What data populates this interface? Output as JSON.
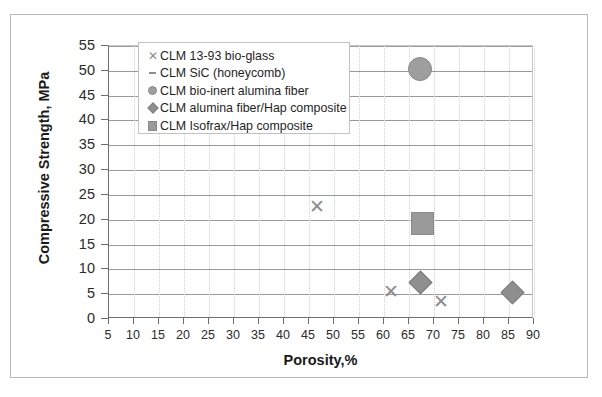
{
  "chart_data": {
    "type": "scatter",
    "title": "",
    "xlabel": "Porosity,%",
    "ylabel": "Compressive Strength, MPa",
    "xlim": [
      5,
      90
    ],
    "ylim": [
      0,
      55
    ],
    "xticks": [
      5,
      10,
      15,
      20,
      25,
      30,
      35,
      40,
      45,
      50,
      55,
      60,
      65,
      70,
      75,
      80,
      85,
      90
    ],
    "yticks": [
      0,
      5,
      10,
      15,
      20,
      25,
      30,
      35,
      40,
      45,
      50,
      55
    ],
    "grid": "horizontal",
    "legend_position": "top-left-inside",
    "series": [
      {
        "name": "CLM 13-93 bio-glass",
        "marker": "cross",
        "color": "#8e8e8e",
        "points": [
          {
            "x": 46.8,
            "y": 22.5
          },
          {
            "x": 61.5,
            "y": 5.5
          },
          {
            "x": 71.5,
            "y": 3.5
          }
        ]
      },
      {
        "name": "CLM SiC (honeycomb)",
        "marker": "dash",
        "color": "#8e8e8e",
        "points": []
      },
      {
        "name": "CLM bio-inert alumina fiber",
        "marker": "circle",
        "color": "#9e9e9e",
        "points": [
          {
            "x": 67.0,
            "y": 50.5
          }
        ]
      },
      {
        "name": "CLM alumina fiber/Hap composite",
        "marker": "diamond",
        "color": "#8f8f8f",
        "points": [
          {
            "x": 67.0,
            "y": 7.5
          },
          {
            "x": 85.5,
            "y": 5.5
          }
        ]
      },
      {
        "name": "CLM Isofrax/Hap composite",
        "marker": "square",
        "color": "#9a9a9a",
        "points": [
          {
            "x": 67.5,
            "y": 19.5
          }
        ]
      }
    ]
  },
  "axes": {
    "x_title": "Porosity,%",
    "y_title": "Compressive Strength, MPa",
    "x_tick_labels": [
      "5",
      "10",
      "15",
      "20",
      "25",
      "30",
      "35",
      "40",
      "45",
      "50",
      "55",
      "60",
      "65",
      "70",
      "75",
      "80",
      "85",
      "90"
    ],
    "y_tick_labels": [
      "0",
      "5",
      "10",
      "15",
      "20",
      "25",
      "30",
      "35",
      "40",
      "45",
      "50",
      "55"
    ]
  },
  "legend": {
    "items": [
      {
        "label": "CLM 13-93 bio-glass",
        "symbol": "cross-marker"
      },
      {
        "label": "CLM SiC (honeycomb)",
        "symbol": "dash-marker"
      },
      {
        "label": "CLM bio-inert alumina fiber",
        "symbol": "circle-marker"
      },
      {
        "label": "CLM alumina fiber/Hap composite",
        "symbol": "diamond-marker"
      },
      {
        "label": "CLM Isofrax/Hap composite",
        "symbol": "square-marker"
      }
    ]
  },
  "colors": {
    "marker_gray": "#9a9a9a",
    "axis": "#6e6e6e",
    "gridline": "#9a9a9a",
    "text": "#1f1f1f",
    "frame": "#b9b9b9"
  }
}
